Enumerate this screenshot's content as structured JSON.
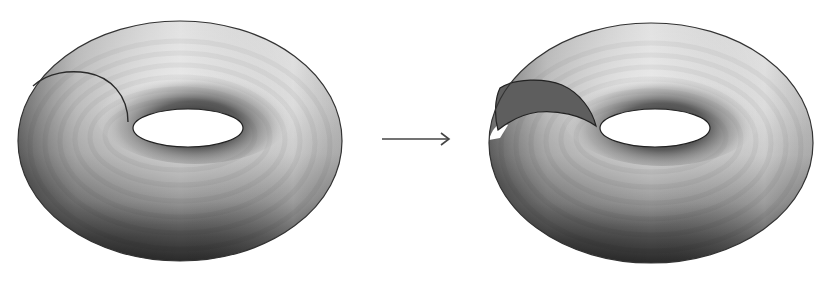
{
  "figure": {
    "left_panel": {
      "label": "torus-with-cut-line",
      "cut_line_color": "#2a2a2a"
    },
    "arrow": {
      "direction": "right",
      "color": "#444444"
    },
    "right_panel": {
      "label": "torus-cut-open",
      "cross_section_color": "#5e5e5e"
    },
    "colors": {
      "background": "#ffffff",
      "surface_light": "#e8e8e8",
      "surface_mid": "#a9a9a9",
      "surface_dark": "#2c2c2c",
      "outline": "#333333",
      "hole": "#ffffff"
    }
  }
}
